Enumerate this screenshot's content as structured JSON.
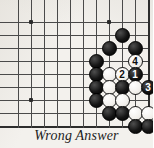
{
  "caption": "Wrong Answer",
  "colors": {
    "board_background": "#f3f1ed",
    "grid_line": "#4a4a4a",
    "board_edge": "#2d2d2d",
    "black_stone": "#000000",
    "white_stone": "#ffffff",
    "caption_text": "#1c1c1c"
  },
  "board": {
    "type": "go-board-problem-diagram",
    "columns": 10,
    "rows": 9,
    "cell_size": 13,
    "origin_x": 18,
    "origin_y": 22,
    "edges": {
      "right": true,
      "bottom": true
    },
    "star_points": [
      {
        "col": 1,
        "row": 0
      },
      {
        "col": 7,
        "row": 0
      },
      {
        "col": 1,
        "row": 6
      }
    ],
    "stones": [
      {
        "col": 8,
        "row": 1,
        "color": "black",
        "label": ""
      },
      {
        "col": 7,
        "row": 2,
        "color": "black",
        "label": ""
      },
      {
        "col": 9,
        "row": 2,
        "color": "black",
        "label": ""
      },
      {
        "col": 6,
        "row": 3,
        "color": "black",
        "label": ""
      },
      {
        "col": 9,
        "row": 3,
        "color": "white",
        "label": "4"
      },
      {
        "col": 6,
        "row": 4,
        "color": "black",
        "label": ""
      },
      {
        "col": 7,
        "row": 4,
        "color": "white",
        "label": ""
      },
      {
        "col": 8,
        "row": 4,
        "color": "white",
        "label": "2"
      },
      {
        "col": 9,
        "row": 4,
        "color": "black",
        "label": "1"
      },
      {
        "col": 6,
        "row": 5,
        "color": "black",
        "label": ""
      },
      {
        "col": 7,
        "row": 5,
        "color": "white",
        "label": ""
      },
      {
        "col": 8,
        "row": 5,
        "color": "black",
        "label": ""
      },
      {
        "col": 9,
        "row": 5,
        "color": "white",
        "label": ""
      },
      {
        "col": 10,
        "row": 5,
        "color": "black",
        "label": "3"
      },
      {
        "col": 6,
        "row": 6,
        "color": "black",
        "label": ""
      },
      {
        "col": 7,
        "row": 6,
        "color": "white",
        "label": ""
      },
      {
        "col": 8,
        "row": 6,
        "color": "white",
        "label": ""
      },
      {
        "col": 7,
        "row": 7,
        "color": "black",
        "label": ""
      },
      {
        "col": 8,
        "row": 7,
        "color": "black",
        "label": ""
      },
      {
        "col": 9,
        "row": 7,
        "color": "white",
        "label": ""
      },
      {
        "col": 10,
        "row": 7,
        "color": "white",
        "label": ""
      },
      {
        "col": 9,
        "row": 8,
        "color": "black",
        "label": ""
      },
      {
        "col": 10,
        "row": 8,
        "color": "black",
        "label": ""
      }
    ],
    "move_sequence": [
      {
        "number": "1",
        "color": "black"
      },
      {
        "number": "2",
        "color": "white"
      },
      {
        "number": "3",
        "color": "black"
      },
      {
        "number": "4",
        "color": "white"
      }
    ]
  }
}
